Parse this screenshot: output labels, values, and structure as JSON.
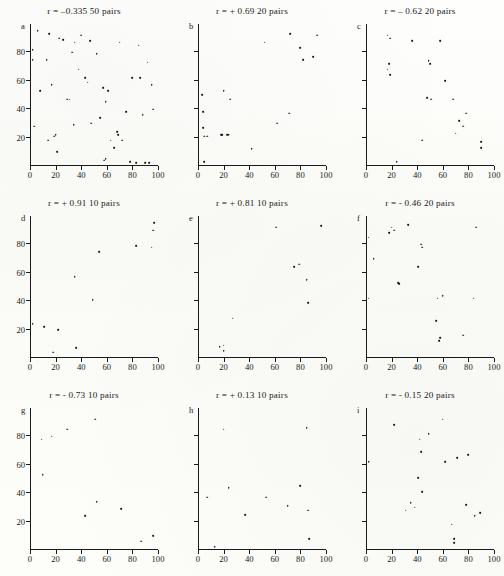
{
  "figure": {
    "kind": "scatterplot-matrix",
    "panel_count": 9,
    "axis": {
      "xlim": [
        0,
        100
      ],
      "ylim": [
        0,
        100
      ],
      "xticks": [
        0,
        20,
        40,
        60,
        80,
        100
      ],
      "yticks": [
        20,
        40,
        60,
        80
      ]
    }
  },
  "chart_data": [
    {
      "type": "scatter",
      "panel": "a",
      "title": "r = –0.335   50 pairs",
      "r": -0.335,
      "n_pairs": 50,
      "xlabel": "",
      "ylabel": "",
      "xlim": [
        0,
        100
      ],
      "ylim": [
        0,
        100
      ],
      "xticks": [
        0,
        20,
        40,
        60,
        80,
        100
      ],
      "yticks": [
        20,
        40,
        60,
        80
      ],
      "show_ytick_labels": true,
      "grid": false,
      "points": [
        [
          2,
          82
        ],
        [
          2,
          75
        ],
        [
          3,
          28
        ],
        [
          6,
          95
        ],
        [
          8,
          53
        ],
        [
          13,
          75
        ],
        [
          14,
          18
        ],
        [
          15,
          93
        ],
        [
          17,
          57
        ],
        [
          19,
          21
        ],
        [
          20,
          22
        ],
        [
          21,
          10
        ],
        [
          23,
          90
        ],
        [
          26,
          89
        ],
        [
          29,
          47
        ],
        [
          31,
          47
        ],
        [
          33,
          80
        ],
        [
          34,
          29
        ],
        [
          35,
          87
        ],
        [
          38,
          68
        ],
        [
          40,
          92
        ],
        [
          43,
          62
        ],
        [
          45,
          59
        ],
        [
          47,
          88
        ],
        [
          48,
          30
        ],
        [
          52,
          79
        ],
        [
          55,
          34
        ],
        [
          57,
          55
        ],
        [
          58,
          4
        ],
        [
          59,
          5
        ],
        [
          59,
          45
        ],
        [
          61,
          53
        ],
        [
          63,
          18
        ],
        [
          66,
          13
        ],
        [
          68,
          24
        ],
        [
          69,
          22
        ],
        [
          70,
          87
        ],
        [
          72,
          18
        ],
        [
          75,
          38
        ],
        [
          78,
          3
        ],
        [
          80,
          62
        ],
        [
          83,
          2
        ],
        [
          85,
          85
        ],
        [
          86,
          62
        ],
        [
          88,
          36
        ],
        [
          90,
          2
        ],
        [
          92,
          73
        ],
        [
          93,
          2
        ],
        [
          95,
          57
        ],
        [
          96,
          40
        ]
      ]
    },
    {
      "type": "scatter",
      "panel": "b",
      "title": "r = + 0.69   20 pairs",
      "r": 0.69,
      "n_pairs": 20,
      "xlabel": "",
      "ylabel": "",
      "xlim": [
        0,
        100
      ],
      "ylim": [
        0,
        100
      ],
      "xticks": [
        0,
        20,
        40,
        60,
        80,
        100
      ],
      "yticks": [
        20,
        40,
        60,
        80
      ],
      "show_ytick_labels": false,
      "grid": false,
      "points": [
        [
          3,
          50
        ],
        [
          4,
          38
        ],
        [
          4,
          27
        ],
        [
          5,
          3
        ],
        [
          5,
          21
        ],
        [
          7,
          21
        ],
        [
          18,
          22
        ],
        [
          19,
          22
        ],
        [
          20,
          53
        ],
        [
          23,
          22
        ],
        [
          24,
          22
        ],
        [
          25,
          47
        ],
        [
          42,
          12
        ],
        [
          52,
          87
        ],
        [
          62,
          30
        ],
        [
          71,
          37
        ],
        [
          72,
          93
        ],
        [
          80,
          83
        ],
        [
          82,
          75
        ],
        [
          90,
          77
        ],
        [
          93,
          92
        ]
      ]
    },
    {
      "type": "scatter",
      "panel": "c",
      "title": "r = – 0.62  20 pairs",
      "r": -0.62,
      "n_pairs": 20,
      "xlabel": "",
      "ylabel": "",
      "xlim": [
        0,
        100
      ],
      "ylim": [
        0,
        100
      ],
      "xticks": [
        0,
        20,
        40,
        60,
        80,
        100
      ],
      "yticks": [
        20,
        40,
        60,
        80
      ],
      "show_ytick_labels": false,
      "grid": false,
      "points": [
        [
          17,
          92
        ],
        [
          19,
          90
        ],
        [
          18,
          72
        ],
        [
          17,
          68
        ],
        [
          19,
          64
        ],
        [
          24,
          3
        ],
        [
          36,
          88
        ],
        [
          44,
          18
        ],
        [
          48,
          48
        ],
        [
          49,
          74
        ],
        [
          50,
          72
        ],
        [
          51,
          47
        ],
        [
          58,
          88
        ],
        [
          62,
          60
        ],
        [
          68,
          47
        ],
        [
          70,
          23
        ],
        [
          73,
          32
        ],
        [
          76,
          28
        ],
        [
          78,
          37
        ],
        [
          90,
          17
        ],
        [
          90,
          13
        ]
      ]
    },
    {
      "type": "scatter",
      "panel": "d",
      "title": "r = + 0.91 10 pairs",
      "r": 0.91,
      "n_pairs": 10,
      "xlabel": "",
      "ylabel": "",
      "xlim": [
        0,
        100
      ],
      "ylim": [
        0,
        100
      ],
      "xticks": [
        0,
        20,
        40,
        60,
        80,
        100
      ],
      "yticks": [
        20,
        40,
        60,
        80
      ],
      "show_ytick_labels": true,
      "grid": false,
      "points": [
        [
          2,
          24
        ],
        [
          11,
          22
        ],
        [
          18,
          4
        ],
        [
          22,
          20
        ],
        [
          36,
          7
        ],
        [
          35,
          57
        ],
        [
          49,
          41
        ],
        [
          54,
          75
        ],
        [
          83,
          79
        ],
        [
          95,
          78
        ],
        [
          96,
          90
        ],
        [
          97,
          95
        ]
      ]
    },
    {
      "type": "scatter",
      "panel": "e",
      "title": "r = + 0.81 10 pairs",
      "r": 0.81,
      "n_pairs": 10,
      "xlabel": "",
      "ylabel": "",
      "xlim": [
        0,
        100
      ],
      "ylim": [
        0,
        100
      ],
      "xticks": [
        0,
        20,
        40,
        60,
        80,
        100
      ],
      "yticks": [
        20,
        40,
        60,
        80
      ],
      "show_ytick_labels": false,
      "grid": false,
      "points": [
        [
          17,
          8
        ],
        [
          20,
          9
        ],
        [
          20,
          5
        ],
        [
          27,
          28
        ],
        [
          61,
          92
        ],
        [
          75,
          64
        ],
        [
          79,
          66
        ],
        [
          85,
          55
        ],
        [
          86,
          39
        ],
        [
          96,
          93
        ]
      ]
    },
    {
      "type": "scatter",
      "panel": "f",
      "title": "r = - 0.46 20 pairs",
      "r": -0.46,
      "n_pairs": 20,
      "xlabel": "",
      "ylabel": "",
      "xlim": [
        0,
        100
      ],
      "ylim": [
        0,
        100
      ],
      "xticks": [
        0,
        20,
        40,
        60,
        80,
        100
      ],
      "yticks": [
        20,
        40,
        60,
        80
      ],
      "show_ytick_labels": false,
      "grid": false,
      "points": [
        [
          2,
          85
        ],
        [
          6,
          70
        ],
        [
          2,
          42
        ],
        [
          18,
          88
        ],
        [
          20,
          92
        ],
        [
          22,
          90
        ],
        [
          26,
          52
        ],
        [
          25,
          53
        ],
        [
          33,
          94
        ],
        [
          43,
          80
        ],
        [
          44,
          78
        ],
        [
          41,
          64
        ],
        [
          55,
          26
        ],
        [
          56,
          42
        ],
        [
          57,
          12
        ],
        [
          58,
          14
        ],
        [
          60,
          44
        ],
        [
          76,
          16
        ],
        [
          84,
          42
        ],
        [
          86,
          92
        ]
      ]
    },
    {
      "type": "scatter",
      "panel": "g",
      "title": "r = - 0.73 10 pairs",
      "r": -0.73,
      "n_pairs": 10,
      "xlabel": "",
      "ylabel": "",
      "xlim": [
        0,
        100
      ],
      "ylim": [
        0,
        100
      ],
      "xticks": [
        0,
        20,
        40,
        60,
        80,
        100
      ],
      "yticks": [
        20,
        40,
        60,
        80
      ],
      "show_ytick_labels": true,
      "grid": false,
      "points": [
        [
          9,
          78
        ],
        [
          10,
          53
        ],
        [
          17,
          80
        ],
        [
          29,
          85
        ],
        [
          43,
          24
        ],
        [
          51,
          92
        ],
        [
          52,
          34
        ],
        [
          71,
          29
        ],
        [
          87,
          6
        ],
        [
          96,
          10
        ]
      ]
    },
    {
      "type": "scatter",
      "panel": "h",
      "title": "r = + 0.13 10 pairs",
      "r": 0.13,
      "n_pairs": 10,
      "xlabel": "",
      "ylabel": "",
      "xlim": [
        0,
        100
      ],
      "ylim": [
        0,
        100
      ],
      "xticks": [
        0,
        20,
        40,
        60,
        80,
        100
      ],
      "yticks": [
        20,
        40,
        60,
        80
      ],
      "show_ytick_labels": false,
      "grid": false,
      "points": [
        [
          7,
          37
        ],
        [
          13,
          2
        ],
        [
          20,
          85
        ],
        [
          24,
          44
        ],
        [
          37,
          25
        ],
        [
          53,
          37
        ],
        [
          70,
          31
        ],
        [
          80,
          45
        ],
        [
          85,
          86
        ],
        [
          86,
          28
        ],
        [
          87,
          8
        ]
      ]
    },
    {
      "type": "scatter",
      "panel": "i",
      "title": "r = - 0.15 20 pairs",
      "r": -0.15,
      "n_pairs": 20,
      "xlabel": "",
      "ylabel": "",
      "xlim": [
        0,
        100
      ],
      "ylim": [
        0,
        100
      ],
      "xticks": [
        0,
        20,
        40,
        60,
        80,
        100
      ],
      "yticks": [
        20,
        40,
        60,
        80
      ],
      "show_ytick_labels": false,
      "grid": false,
      "points": [
        [
          2,
          62
        ],
        [
          22,
          88
        ],
        [
          31,
          28
        ],
        [
          35,
          33
        ],
        [
          38,
          30
        ],
        [
          41,
          51
        ],
        [
          42,
          78
        ],
        [
          43,
          69
        ],
        [
          44,
          41
        ],
        [
          49,
          82
        ],
        [
          60,
          92
        ],
        [
          62,
          62
        ],
        [
          67,
          18
        ],
        [
          69,
          8
        ],
        [
          69,
          5
        ],
        [
          71,
          65
        ],
        [
          78,
          32
        ],
        [
          80,
          67
        ],
        [
          85,
          24
        ],
        [
          89,
          26
        ]
      ]
    }
  ]
}
